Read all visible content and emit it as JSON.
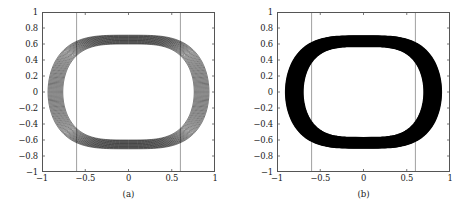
{
  "figure": {
    "background": "#ffffff",
    "axis_color": "#555555",
    "curve_color": "#000000",
    "reference_line_color": "#777777"
  },
  "chart_data": [
    {
      "type": "line",
      "panel_id": "a",
      "caption": "(a)",
      "title": "",
      "xlabel": "",
      "ylabel": "",
      "xlim": [
        -1,
        1
      ],
      "ylim": [
        -1,
        1
      ],
      "grid": false,
      "legend": null,
      "xticks": [
        -1,
        -0.5,
        0,
        0.5,
        1
      ],
      "xticklabels": [
        "−1",
        "−0.5",
        "0",
        "0.5",
        "1"
      ],
      "yticks": [
        1,
        0.8,
        0.6,
        0.4,
        0.2,
        0,
        -0.2,
        -0.4,
        -0.6,
        -0.8,
        -1
      ],
      "yticklabels": [
        "1",
        "0.8",
        "0.6",
        "0.4",
        "0.2",
        "0",
        "−0.2",
        "−0.4",
        "−0.6",
        "−0.8",
        "−1"
      ],
      "annotations": [
        {
          "kind": "vline",
          "x": -0.6,
          "label": "x = -0.6"
        },
        {
          "kind": "vline",
          "x": 0.6,
          "label": "x = 0.6"
        }
      ],
      "description": "Overlaid closed phase-space orbits forming a lens/eye shaped band with sharp cusps on the left and right; individual trajectory strands are resolvable.",
      "orbit_band": {
        "count": 16,
        "y_extent_max": 0.71,
        "y_extent_min": 0.6,
        "cusp_x_max": 0.93,
        "cusp_x_min": 0.76,
        "strand_separation": "wide"
      }
    },
    {
      "type": "line",
      "panel_id": "b",
      "caption": "(b)",
      "title": "",
      "xlabel": "",
      "ylabel": "",
      "xlim": [
        -1,
        1
      ],
      "ylim": [
        -1,
        1
      ],
      "grid": false,
      "legend": null,
      "xticks": [
        -1,
        -0.5,
        0,
        0.5,
        1
      ],
      "xticklabels": [
        "−1",
        "−0.5",
        "0",
        "0.5",
        "1"
      ],
      "yticks": [
        1,
        0.8,
        0.6,
        0.4,
        0.2,
        0,
        -0.2,
        -0.4,
        -0.6,
        -0.8,
        -1
      ],
      "yticklabels": [
        "1",
        "0.8",
        "0.6",
        "0.4",
        "0.2",
        "0",
        "−0.2",
        "−0.4",
        "−0.6",
        "−0.8",
        "−1"
      ],
      "annotations": [
        {
          "kind": "vline",
          "x": -0.6,
          "label": "x = -0.6"
        },
        {
          "kind": "vline",
          "x": 0.6,
          "label": "x = 0.6"
        }
      ],
      "description": "Overlaid closed phase-space orbits forming a dense solid black lens/eye shaped band with cusps on the left and right; strands are not individually resolvable.",
      "orbit_band": {
        "count": 40,
        "y_extent_max": 0.7,
        "y_extent_min": 0.57,
        "cusp_x_max": 0.9,
        "cusp_x_min": 0.7,
        "strand_separation": "dense"
      }
    }
  ]
}
